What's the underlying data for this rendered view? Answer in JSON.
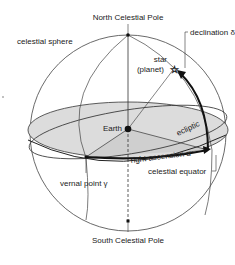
{
  "diagram": {
    "labels": {
      "north_pole": "North Celestial Pole",
      "south_pole": "South Celestial Pole",
      "sphere": "celestial sphere",
      "declination": "declination δ",
      "star_line1": "star",
      "star_line2": "(planet)",
      "earth": "Earth",
      "ecliptic": "ecliptic",
      "right_ascension": "right ascension α",
      "celestial_equator": "celestial equator",
      "vernal_point": "vernal point γ"
    },
    "colors": {
      "line": "#333333",
      "shade": "#d9d9d9",
      "background": "#ffffff"
    }
  }
}
